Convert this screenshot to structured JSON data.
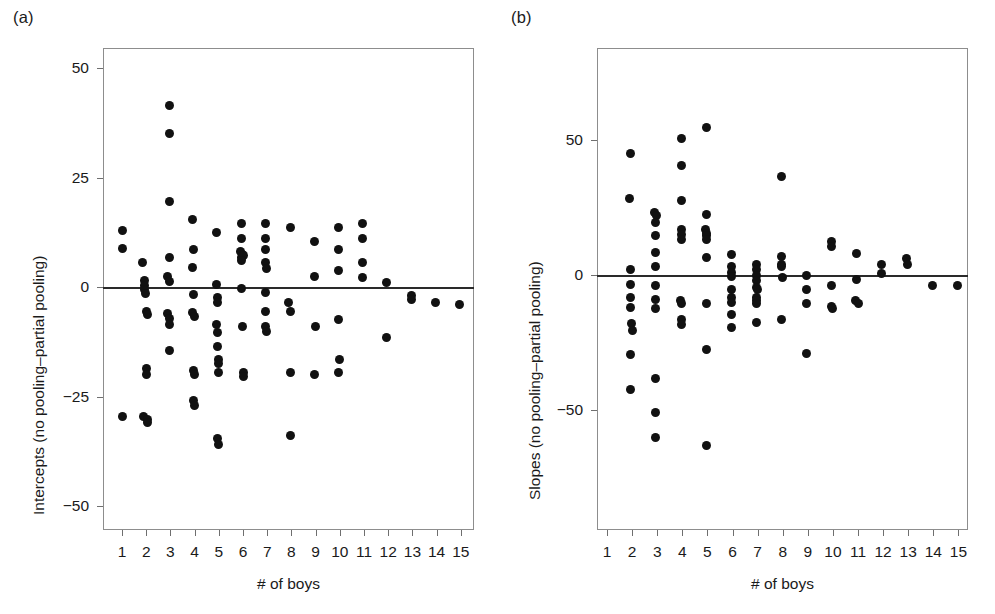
{
  "figure": {
    "background": "#ffffff",
    "dot_color": "#111111",
    "axis_color": "#8d8d8d",
    "zero_line_color": "#2a2a2a"
  },
  "panels": [
    {
      "id": "a",
      "label": "(a)",
      "ylabel": "Intercepts (no pooling–partial pooling)",
      "xlabel": "# of boys",
      "yticks": [
        "50",
        "25",
        "0",
        "−25",
        "−50"
      ],
      "ytick_values": [
        50,
        25,
        0,
        -25,
        -50
      ],
      "xticks": [
        "1",
        "2",
        "3",
        "4",
        "5",
        "6",
        "7",
        "8",
        "9",
        "10",
        "11",
        "12",
        "13",
        "14",
        "15"
      ],
      "xtick_values": [
        1,
        2,
        3,
        4,
        5,
        6,
        7,
        8,
        9,
        10,
        11,
        12,
        13,
        14,
        15
      ]
    },
    {
      "id": "b",
      "label": "(b)",
      "ylabel": "Slopes (no pooling–partial pooling)",
      "xlabel": "# of boys",
      "yticks": [
        "50",
        "0",
        "−50"
      ],
      "ytick_values": [
        50,
        0,
        -50
      ],
      "xticks": [
        "1",
        "2",
        "3",
        "4",
        "5",
        "6",
        "7",
        "8",
        "9",
        "10",
        "11",
        "12",
        "13",
        "14",
        "15"
      ],
      "xtick_values": [
        1,
        2,
        3,
        4,
        5,
        6,
        7,
        8,
        9,
        10,
        11,
        12,
        13,
        14,
        15
      ]
    }
  ],
  "chart_data": [
    {
      "type": "scatter",
      "panel": "a",
      "title": "(a)",
      "xlabel": "# of boys",
      "ylabel": "Intercepts (no pooling–partial pooling)",
      "xlim": [
        0.2,
        15.8
      ],
      "ylim": [
        -57,
        55
      ],
      "grid": false,
      "legend": null,
      "annotations": [
        "horizontal reference line at y = 0"
      ],
      "points": [
        {
          "x": 1.0,
          "y": 13.0
        },
        {
          "x": 1.0,
          "y": 8.8
        },
        {
          "x": 1.0,
          "y": -29.5
        },
        {
          "x": 1.85,
          "y": 5.5
        },
        {
          "x": 1.95,
          "y": 1.5
        },
        {
          "x": 1.95,
          "y": 0.4
        },
        {
          "x": 1.95,
          "y": -0.6
        },
        {
          "x": 1.98,
          "y": -1.4
        },
        {
          "x": 2.0,
          "y": -5.5
        },
        {
          "x": 2.05,
          "y": -6.2
        },
        {
          "x": 2.0,
          "y": -18.5
        },
        {
          "x": 2.0,
          "y": -20.0
        },
        {
          "x": 1.9,
          "y": -29.5
        },
        {
          "x": 2.05,
          "y": -30.2
        },
        {
          "x": 2.05,
          "y": -31.0
        },
        {
          "x": 2.95,
          "y": 41.5
        },
        {
          "x": 2.95,
          "y": 35.0
        },
        {
          "x": 2.95,
          "y": 19.5
        },
        {
          "x": 2.98,
          "y": 6.8
        },
        {
          "x": 2.9,
          "y": 2.5
        },
        {
          "x": 2.95,
          "y": 1.2
        },
        {
          "x": 2.9,
          "y": -6.0
        },
        {
          "x": 2.95,
          "y": -7.2
        },
        {
          "x": 2.95,
          "y": -8.5
        },
        {
          "x": 2.95,
          "y": -14.5
        },
        {
          "x": 3.9,
          "y": 15.5
        },
        {
          "x": 3.95,
          "y": 8.5
        },
        {
          "x": 3.9,
          "y": 4.5
        },
        {
          "x": 3.95,
          "y": -1.8
        },
        {
          "x": 3.9,
          "y": -5.8
        },
        {
          "x": 3.98,
          "y": -6.8
        },
        {
          "x": 3.95,
          "y": -19.0
        },
        {
          "x": 4.0,
          "y": -20.0
        },
        {
          "x": 3.95,
          "y": -26.0
        },
        {
          "x": 4.0,
          "y": -27.0
        },
        {
          "x": 4.9,
          "y": 12.5
        },
        {
          "x": 4.92,
          "y": 0.5
        },
        {
          "x": 4.95,
          "y": -2.5
        },
        {
          "x": 4.95,
          "y": -3.5
        },
        {
          "x": 4.9,
          "y": -8.5
        },
        {
          "x": 4.95,
          "y": -10.5
        },
        {
          "x": 4.95,
          "y": -13.5
        },
        {
          "x": 4.98,
          "y": -16.5
        },
        {
          "x": 5.0,
          "y": -17.5
        },
        {
          "x": 5.0,
          "y": -19.5
        },
        {
          "x": 4.95,
          "y": -34.5
        },
        {
          "x": 5.0,
          "y": -36.0
        },
        {
          "x": 5.95,
          "y": 14.5
        },
        {
          "x": 5.95,
          "y": 11.0
        },
        {
          "x": 5.9,
          "y": 8.0
        },
        {
          "x": 5.98,
          "y": 7.5
        },
        {
          "x": 5.95,
          "y": 6.8
        },
        {
          "x": 6.02,
          "y": 7.2
        },
        {
          "x": 5.95,
          "y": 6.0
        },
        {
          "x": 5.92,
          "y": -0.3
        },
        {
          "x": 5.98,
          "y": -9.0
        },
        {
          "x": 6.0,
          "y": -19.5
        },
        {
          "x": 6.0,
          "y": -20.5
        },
        {
          "x": 6.95,
          "y": 14.5
        },
        {
          "x": 6.95,
          "y": 11.0
        },
        {
          "x": 6.95,
          "y": 8.5
        },
        {
          "x": 6.95,
          "y": 5.5
        },
        {
          "x": 6.98,
          "y": 4.2
        },
        {
          "x": 6.95,
          "y": -1.2
        },
        {
          "x": 6.95,
          "y": -5.5
        },
        {
          "x": 6.95,
          "y": -9.0
        },
        {
          "x": 6.98,
          "y": -10.2
        },
        {
          "x": 7.95,
          "y": 13.5
        },
        {
          "x": 7.9,
          "y": -3.5
        },
        {
          "x": 7.95,
          "y": -5.5
        },
        {
          "x": 7.95,
          "y": -19.5
        },
        {
          "x": 7.95,
          "y": -34.0
        },
        {
          "x": 8.95,
          "y": 10.5
        },
        {
          "x": 8.95,
          "y": 2.5
        },
        {
          "x": 8.98,
          "y": -9.0
        },
        {
          "x": 8.95,
          "y": -20.0
        },
        {
          "x": 9.95,
          "y": 13.5
        },
        {
          "x": 9.95,
          "y": 8.5
        },
        {
          "x": 9.95,
          "y": 3.8
        },
        {
          "x": 9.95,
          "y": -7.5
        },
        {
          "x": 9.98,
          "y": -16.5
        },
        {
          "x": 9.95,
          "y": -19.5
        },
        {
          "x": 10.95,
          "y": 14.5
        },
        {
          "x": 10.95,
          "y": 11.0
        },
        {
          "x": 10.95,
          "y": 5.5
        },
        {
          "x": 10.95,
          "y": 2.2
        },
        {
          "x": 11.95,
          "y": 1.0
        },
        {
          "x": 11.95,
          "y": -11.5
        },
        {
          "x": 12.95,
          "y": -2.0
        },
        {
          "x": 12.98,
          "y": -2.8
        },
        {
          "x": 13.95,
          "y": -3.5
        },
        {
          "x": 14.95,
          "y": -4.0
        }
      ]
    },
    {
      "type": "scatter",
      "panel": "b",
      "title": "(b)",
      "xlabel": "# of boys",
      "ylabel": "Slopes (no pooling–partial pooling)",
      "xlim": [
        0.2,
        15.8
      ],
      "ylim": [
        -90,
        85
      ],
      "grid": false,
      "legend": null,
      "annotations": [
        "horizontal reference line at y = 0"
      ],
      "points": [
        {
          "x": 1.95,
          "y": 45.0
        },
        {
          "x": 1.9,
          "y": 28.5
        },
        {
          "x": 1.95,
          "y": 2.0
        },
        {
          "x": 1.95,
          "y": -3.5
        },
        {
          "x": 1.95,
          "y": -8.5
        },
        {
          "x": 1.95,
          "y": -12.0
        },
        {
          "x": 1.98,
          "y": -18.0
        },
        {
          "x": 2.0,
          "y": -20.5
        },
        {
          "x": 1.95,
          "y": -29.5
        },
        {
          "x": 1.95,
          "y": -42.5
        },
        {
          "x": 2.9,
          "y": 23.0
        },
        {
          "x": 2.98,
          "y": 22.0
        },
        {
          "x": 2.92,
          "y": 19.5
        },
        {
          "x": 2.95,
          "y": 14.5
        },
        {
          "x": 2.95,
          "y": 8.5
        },
        {
          "x": 2.95,
          "y": 3.0
        },
        {
          "x": 2.95,
          "y": -4.0
        },
        {
          "x": 2.95,
          "y": -9.0
        },
        {
          "x": 2.95,
          "y": -12.5
        },
        {
          "x": 2.95,
          "y": -38.5
        },
        {
          "x": 2.95,
          "y": -51.0
        },
        {
          "x": 2.95,
          "y": -60.0
        },
        {
          "x": 3.95,
          "y": 50.5
        },
        {
          "x": 3.95,
          "y": 40.5
        },
        {
          "x": 3.95,
          "y": 27.5
        },
        {
          "x": 3.95,
          "y": 17.0
        },
        {
          "x": 3.95,
          "y": 15.0
        },
        {
          "x": 3.95,
          "y": 13.0
        },
        {
          "x": 3.92,
          "y": -9.5
        },
        {
          "x": 3.98,
          "y": -10.5
        },
        {
          "x": 3.95,
          "y": -16.5
        },
        {
          "x": 3.95,
          "y": -18.5
        },
        {
          "x": 4.95,
          "y": 54.5
        },
        {
          "x": 4.95,
          "y": 22.5
        },
        {
          "x": 4.92,
          "y": 17.0
        },
        {
          "x": 4.98,
          "y": 15.5
        },
        {
          "x": 4.95,
          "y": 14.5
        },
        {
          "x": 4.95,
          "y": 13.0
        },
        {
          "x": 4.95,
          "y": 6.5
        },
        {
          "x": 4.95,
          "y": -10.5
        },
        {
          "x": 4.95,
          "y": -27.5
        },
        {
          "x": 4.95,
          "y": -63.0
        },
        {
          "x": 5.95,
          "y": 7.5
        },
        {
          "x": 5.95,
          "y": 3.0
        },
        {
          "x": 5.95,
          "y": 1.0
        },
        {
          "x": 5.95,
          "y": -0.5
        },
        {
          "x": 5.95,
          "y": -5.5
        },
        {
          "x": 5.95,
          "y": -8.5
        },
        {
          "x": 5.98,
          "y": -10.0
        },
        {
          "x": 5.95,
          "y": -14.5
        },
        {
          "x": 5.95,
          "y": -19.5
        },
        {
          "x": 6.95,
          "y": 4.0
        },
        {
          "x": 6.95,
          "y": 2.0
        },
        {
          "x": 6.95,
          "y": 0.0
        },
        {
          "x": 6.95,
          "y": -2.0
        },
        {
          "x": 6.95,
          "y": -4.5
        },
        {
          "x": 6.98,
          "y": -5.5
        },
        {
          "x": 6.95,
          "y": -8.5
        },
        {
          "x": 6.95,
          "y": -9.5
        },
        {
          "x": 6.95,
          "y": -10.5
        },
        {
          "x": 6.95,
          "y": -17.5
        },
        {
          "x": 7.95,
          "y": 36.5
        },
        {
          "x": 7.95,
          "y": 7.0
        },
        {
          "x": 7.95,
          "y": 4.0
        },
        {
          "x": 7.95,
          "y": 3.0
        },
        {
          "x": 7.98,
          "y": -1.0
        },
        {
          "x": 7.95,
          "y": -16.5
        },
        {
          "x": 8.95,
          "y": 0.0
        },
        {
          "x": 8.95,
          "y": -5.5
        },
        {
          "x": 8.95,
          "y": -10.5
        },
        {
          "x": 8.95,
          "y": -29.0
        },
        {
          "x": 9.95,
          "y": 12.5
        },
        {
          "x": 9.95,
          "y": 10.5
        },
        {
          "x": 9.95,
          "y": -4.0
        },
        {
          "x": 9.95,
          "y": -11.5
        },
        {
          "x": 9.98,
          "y": -12.5
        },
        {
          "x": 10.95,
          "y": 8.0
        },
        {
          "x": 10.95,
          "y": -1.5
        },
        {
          "x": 10.9,
          "y": -9.5
        },
        {
          "x": 11.0,
          "y": -10.5
        },
        {
          "x": 11.95,
          "y": 4.0
        },
        {
          "x": 11.95,
          "y": 0.5
        },
        {
          "x": 12.95,
          "y": 6.0
        },
        {
          "x": 12.98,
          "y": 4.0
        },
        {
          "x": 13.95,
          "y": -4.0
        },
        {
          "x": 14.95,
          "y": -4.0
        }
      ]
    }
  ]
}
